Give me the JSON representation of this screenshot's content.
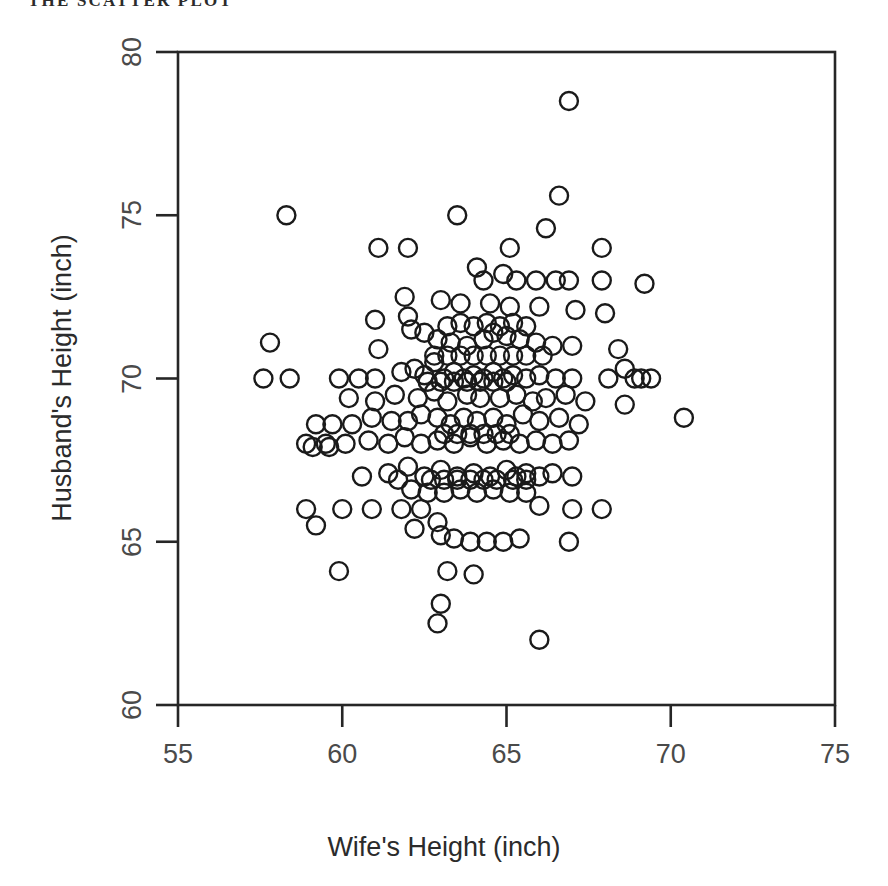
{
  "page": {
    "running_header": "THE SCATTER PLOT"
  },
  "chart_data": {
    "type": "scatter",
    "title": "",
    "xlabel": "Wife's Height (inch)",
    "ylabel": "Husband's Height (inch)",
    "xlim": [
      55,
      75
    ],
    "ylim": [
      60,
      80
    ],
    "xticks": [
      55,
      60,
      65,
      70,
      75
    ],
    "yticks": [
      60,
      65,
      70,
      75,
      80
    ],
    "xticklabels": [
      "55",
      "60",
      "65",
      "70",
      "75"
    ],
    "yticklabels": [
      "60",
      "65",
      "70",
      "75",
      "80"
    ],
    "grid": false,
    "legend": null,
    "marker": {
      "shape": "circle-open",
      "edge_color": "#1a1a1a",
      "fill_color": "none",
      "diameter_px": 18,
      "line_width_px": 2.4
    },
    "axes_box": {
      "left_px": 178,
      "right_px": 835,
      "top_px": 52,
      "bottom_px": 705
    },
    "n_points": 199,
    "series": [
      {
        "name": "couples",
        "points": [
          [
            58.3,
            75.0
          ],
          [
            63.5,
            75.0
          ],
          [
            66.9,
            78.5
          ],
          [
            66.6,
            75.6
          ],
          [
            61.1,
            74.0
          ],
          [
            62.0,
            74.0
          ],
          [
            65.1,
            74.0
          ],
          [
            66.2,
            74.6
          ],
          [
            67.9,
            74.0
          ],
          [
            57.8,
            71.1
          ],
          [
            57.6,
            70.0
          ],
          [
            58.4,
            70.0
          ],
          [
            64.1,
            73.4
          ],
          [
            64.9,
            73.2
          ],
          [
            65.9,
            73.0
          ],
          [
            66.5,
            73.0
          ],
          [
            67.9,
            73.0
          ],
          [
            69.2,
            72.9
          ],
          [
            61.9,
            72.5
          ],
          [
            62.0,
            71.9
          ],
          [
            63.0,
            72.4
          ],
          [
            63.6,
            72.3
          ],
          [
            64.5,
            72.3
          ],
          [
            65.1,
            72.2
          ],
          [
            66.0,
            72.2
          ],
          [
            67.1,
            72.1
          ],
          [
            68.0,
            72.0
          ],
          [
            61.0,
            71.8
          ],
          [
            61.1,
            70.9
          ],
          [
            62.1,
            71.5
          ],
          [
            62.5,
            71.4
          ],
          [
            62.9,
            71.2
          ],
          [
            63.3,
            71.1
          ],
          [
            63.8,
            71.0
          ],
          [
            64.3,
            71.2
          ],
          [
            64.6,
            71.4
          ],
          [
            65.0,
            71.3
          ],
          [
            65.4,
            71.2
          ],
          [
            65.9,
            71.1
          ],
          [
            66.4,
            71.0
          ],
          [
            67.0,
            71.0
          ],
          [
            68.4,
            70.9
          ],
          [
            68.6,
            70.3
          ],
          [
            69.4,
            70.0
          ],
          [
            59.9,
            70.0
          ],
          [
            60.5,
            70.0
          ],
          [
            61.0,
            70.0
          ],
          [
            61.8,
            70.2
          ],
          [
            62.2,
            70.3
          ],
          [
            62.5,
            70.1
          ],
          [
            62.8,
            70.5
          ],
          [
            63.1,
            70.0
          ],
          [
            63.4,
            70.2
          ],
          [
            63.7,
            70.0
          ],
          [
            64.0,
            70.1
          ],
          [
            64.3,
            70.0
          ],
          [
            64.6,
            70.2
          ],
          [
            64.9,
            70.0
          ],
          [
            65.2,
            70.1
          ],
          [
            65.6,
            70.0
          ],
          [
            66.0,
            70.1
          ],
          [
            66.5,
            70.0
          ],
          [
            67.0,
            70.0
          ],
          [
            68.1,
            70.0
          ],
          [
            68.9,
            70.0
          ],
          [
            69.1,
            70.0
          ],
          [
            60.2,
            69.4
          ],
          [
            61.0,
            69.3
          ],
          [
            61.6,
            69.5
          ],
          [
            62.3,
            69.4
          ],
          [
            62.8,
            69.6
          ],
          [
            63.2,
            69.3
          ],
          [
            63.8,
            69.5
          ],
          [
            64.2,
            69.4
          ],
          [
            64.8,
            69.4
          ],
          [
            65.3,
            69.5
          ],
          [
            65.8,
            69.3
          ],
          [
            66.2,
            69.4
          ],
          [
            66.8,
            69.5
          ],
          [
            67.4,
            69.3
          ],
          [
            68.6,
            69.2
          ],
          [
            70.4,
            68.8
          ],
          [
            59.2,
            68.6
          ],
          [
            59.7,
            68.6
          ],
          [
            60.3,
            68.6
          ],
          [
            60.9,
            68.8
          ],
          [
            61.5,
            68.7
          ],
          [
            62.0,
            68.7
          ],
          [
            62.4,
            68.9
          ],
          [
            62.9,
            68.8
          ],
          [
            63.3,
            68.6
          ],
          [
            63.7,
            68.8
          ],
          [
            64.1,
            68.7
          ],
          [
            64.6,
            68.8
          ],
          [
            65.0,
            68.6
          ],
          [
            65.5,
            68.9
          ],
          [
            66.0,
            68.7
          ],
          [
            66.6,
            68.8
          ],
          [
            67.2,
            68.6
          ],
          [
            58.9,
            68.0
          ],
          [
            59.5,
            68.0
          ],
          [
            60.1,
            68.0
          ],
          [
            60.8,
            68.1
          ],
          [
            61.4,
            68.0
          ],
          [
            61.9,
            68.2
          ],
          [
            62.4,
            68.0
          ],
          [
            62.9,
            68.1
          ],
          [
            63.4,
            68.0
          ],
          [
            63.9,
            68.2
          ],
          [
            64.4,
            68.0
          ],
          [
            64.9,
            68.1
          ],
          [
            65.4,
            68.0
          ],
          [
            65.9,
            68.1
          ],
          [
            66.4,
            68.0
          ],
          [
            66.9,
            68.1
          ],
          [
            59.1,
            67.9
          ],
          [
            59.6,
            67.9
          ],
          [
            60.6,
            67.0
          ],
          [
            61.4,
            67.1
          ],
          [
            62.0,
            67.3
          ],
          [
            62.5,
            67.0
          ],
          [
            63.0,
            67.2
          ],
          [
            63.5,
            67.0
          ],
          [
            64.0,
            67.1
          ],
          [
            64.5,
            67.0
          ],
          [
            65.0,
            67.2
          ],
          [
            65.3,
            67.0
          ],
          [
            65.6,
            67.1
          ],
          [
            66.0,
            67.0
          ],
          [
            66.4,
            67.1
          ],
          [
            67.0,
            67.0
          ],
          [
            61.7,
            66.9
          ],
          [
            62.1,
            66.6
          ],
          [
            62.6,
            66.5
          ],
          [
            63.1,
            66.5
          ],
          [
            63.6,
            66.6
          ],
          [
            64.1,
            66.5
          ],
          [
            64.6,
            66.6
          ],
          [
            65.1,
            66.5
          ],
          [
            65.6,
            66.5
          ],
          [
            66.0,
            66.1
          ],
          [
            67.0,
            66.0
          ],
          [
            67.9,
            66.0
          ],
          [
            58.9,
            66.0
          ],
          [
            60.0,
            66.0
          ],
          [
            60.9,
            66.0
          ],
          [
            61.8,
            66.0
          ],
          [
            62.4,
            66.0
          ],
          [
            62.9,
            65.6
          ],
          [
            59.2,
            65.5
          ],
          [
            62.2,
            65.4
          ],
          [
            63.0,
            65.2
          ],
          [
            63.4,
            65.1
          ],
          [
            63.9,
            65.0
          ],
          [
            64.4,
            65.0
          ],
          [
            64.9,
            65.0
          ],
          [
            65.4,
            65.1
          ],
          [
            66.9,
            65.0
          ],
          [
            59.9,
            64.1
          ],
          [
            63.2,
            64.1
          ],
          [
            64.0,
            64.0
          ],
          [
            63.0,
            63.1
          ],
          [
            62.9,
            62.5
          ],
          [
            66.0,
            62.0
          ],
          [
            62.6,
            69.9
          ],
          [
            63.0,
            69.9
          ],
          [
            63.4,
            69.9
          ],
          [
            63.8,
            69.9
          ],
          [
            64.2,
            69.9
          ],
          [
            64.6,
            69.9
          ],
          [
            65.0,
            69.9
          ],
          [
            63.2,
            71.6
          ],
          [
            63.6,
            71.7
          ],
          [
            64.0,
            71.6
          ],
          [
            64.4,
            71.7
          ],
          [
            64.8,
            71.6
          ],
          [
            65.2,
            71.7
          ],
          [
            65.6,
            71.6
          ],
          [
            63.1,
            68.3
          ],
          [
            63.5,
            68.3
          ],
          [
            63.9,
            68.3
          ],
          [
            64.3,
            68.3
          ],
          [
            64.7,
            68.3
          ],
          [
            65.1,
            68.3
          ],
          [
            62.7,
            66.9
          ],
          [
            63.1,
            66.9
          ],
          [
            63.5,
            66.9
          ],
          [
            63.9,
            66.9
          ],
          [
            64.3,
            66.9
          ],
          [
            64.7,
            66.9
          ],
          [
            65.2,
            66.9
          ],
          [
            65.6,
            66.9
          ],
          [
            62.8,
            70.7
          ],
          [
            63.2,
            70.7
          ],
          [
            63.6,
            70.7
          ],
          [
            64.0,
            70.7
          ],
          [
            64.4,
            70.7
          ],
          [
            64.8,
            70.7
          ],
          [
            65.2,
            70.7
          ],
          [
            65.6,
            70.7
          ],
          [
            66.1,
            70.7
          ],
          [
            64.3,
            73.0
          ],
          [
            65.3,
            73.0
          ],
          [
            66.9,
            73.0
          ]
        ]
      }
    ]
  }
}
